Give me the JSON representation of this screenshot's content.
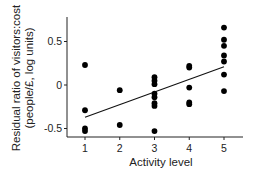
{
  "chart_data": {
    "type": "scatter",
    "title": "",
    "xlabel": "Activity level",
    "ylabel_lines": [
      "Residual ratio of visitors:cost",
      "(people/£, log units)"
    ],
    "ylabel": "Residual ratio of visitors:cost (people/£, log units)",
    "xlim": [
      0.75,
      5.55
    ],
    "ylim": [
      -0.6,
      0.8
    ],
    "x_ticks": [
      1,
      2,
      3,
      4,
      5
    ],
    "x_tick_labels": [
      "1",
      "2",
      "3",
      "4",
      "5"
    ],
    "y_ticks": [
      0.5,
      0,
      -0.5
    ],
    "y_tick_labels": [
      "0.5",
      "0",
      "-0.5"
    ],
    "grid": false,
    "legend": null,
    "points": [
      {
        "x": 1,
        "y": 0.23
      },
      {
        "x": 1,
        "y": -0.29
      },
      {
        "x": 1,
        "y": -0.5
      },
      {
        "x": 1,
        "y": -0.53
      },
      {
        "x": 2,
        "y": -0.06
      },
      {
        "x": 2,
        "y": -0.46
      },
      {
        "x": 3,
        "y": 0.09
      },
      {
        "x": 3,
        "y": 0.05
      },
      {
        "x": 3,
        "y": 0.01
      },
      {
        "x": 3,
        "y": -0.1
      },
      {
        "x": 3,
        "y": -0.14
      },
      {
        "x": 3,
        "y": -0.21
      },
      {
        "x": 3,
        "y": -0.24
      },
      {
        "x": 3,
        "y": -0.53
      },
      {
        "x": 4,
        "y": 0.22
      },
      {
        "x": 4,
        "y": 0.2
      },
      {
        "x": 4,
        "y": -0.03
      },
      {
        "x": 4,
        "y": -0.2
      },
      {
        "x": 4,
        "y": -0.22
      },
      {
        "x": 5,
        "y": 0.66
      },
      {
        "x": 5,
        "y": 0.52
      },
      {
        "x": 5,
        "y": 0.45
      },
      {
        "x": 5,
        "y": 0.34
      },
      {
        "x": 5,
        "y": 0.27
      },
      {
        "x": 5,
        "y": 0.12
      },
      {
        "x": 5,
        "y": -0.07
      }
    ],
    "regression_line": {
      "x": [
        1,
        5
      ],
      "y": [
        -0.37,
        0.21
      ]
    },
    "colors": {
      "points": "#000000",
      "line": "#111111",
      "axis": "#222222"
    }
  }
}
